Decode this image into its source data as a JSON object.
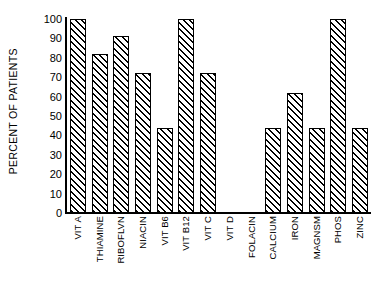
{
  "chart_data": {
    "type": "bar",
    "title": "",
    "subtitle": "",
    "xlabel": "",
    "ylabel": "PERCENT OF PATIENTS",
    "ylim": [
      0,
      100
    ],
    "yticks": [
      0,
      10,
      20,
      30,
      40,
      50,
      60,
      70,
      80,
      90,
      100
    ],
    "ytick_labels": [
      "0",
      "10",
      "20",
      "30",
      "40",
      "50",
      "60",
      "70",
      "80",
      "90",
      "100"
    ],
    "grid": false,
    "legend": null,
    "bar_style": {
      "fill": "hatched-diagonal",
      "hatch": "/",
      "edge_color": "#000000",
      "face_color": "#ffffff"
    },
    "categories": [
      "VIT A",
      "THIAMINE",
      "RIBOFLVN",
      "NIACIN",
      "VIT B6",
      "VIT B12",
      "VIT C",
      "VIT D",
      "FOLACIN",
      "CALCIUM",
      "IRON",
      "MAGNSM",
      "PHOS",
      "ZINC"
    ],
    "values": [
      100,
      82,
      91,
      72,
      44,
      100,
      72,
      0,
      0,
      44,
      62,
      44,
      100,
      44
    ]
  }
}
